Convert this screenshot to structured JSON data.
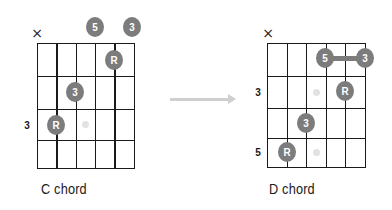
{
  "diagrams": [
    {
      "id": "c",
      "label": "C chord",
      "grid": {
        "x": [
          37,
          56.3,
          75.6,
          94.9,
          114.2,
          133.5
        ],
        "y": [
          43,
          76,
          109,
          140,
          168
        ]
      },
      "mute": {
        "symbol": "×",
        "x": 37,
        "y": 33
      },
      "fret_labels": [
        {
          "text": "3",
          "x": 27,
          "y": 125
        }
      ],
      "dots": [
        {
          "text": "5",
          "x": 95,
          "y": 27
        },
        {
          "text": "3",
          "x": 132,
          "y": 27
        },
        {
          "text": "R",
          "x": 114,
          "y": 60
        },
        {
          "text": "3",
          "x": 75,
          "y": 92
        },
        {
          "text": "R",
          "x": 56,
          "y": 125
        }
      ],
      "ghost_dots": [
        {
          "x": 85,
          "y": 124
        }
      ],
      "label_pos": {
        "x": 41,
        "y": 180
      }
    },
    {
      "id": "d",
      "label": "D chord",
      "grid": {
        "x": [
          267,
          286.5,
          306,
          325.5,
          345,
          364.5
        ],
        "y": [
          43,
          76,
          108,
          138,
          167
        ]
      },
      "mute": {
        "symbol": "×",
        "x": 268,
        "y": 33
      },
      "fret_labels": [
        {
          "text": "3",
          "x": 258,
          "y": 92
        },
        {
          "text": "5",
          "x": 258,
          "y": 152
        }
      ],
      "dots": [
        {
          "text": "5",
          "x": 325,
          "y": 58
        },
        {
          "text": "3",
          "x": 365,
          "y": 58
        },
        {
          "text": "R",
          "x": 345,
          "y": 91
        },
        {
          "text": "3",
          "x": 306,
          "y": 123
        },
        {
          "text": "R",
          "x": 287,
          "y": 152
        }
      ],
      "bar": {
        "x1": 325,
        "x2": 365,
        "y": 58
      },
      "ghost_dots": [
        {
          "x": 316,
          "y": 92
        },
        {
          "x": 316,
          "y": 152
        }
      ],
      "label_pos": {
        "x": 269,
        "y": 180
      }
    }
  ],
  "arrow": {
    "x1": 170,
    "x2": 236,
    "y": 99,
    "color": "#cfcfcf"
  },
  "colors": {
    "dot": "#7c7c7c",
    "dot_text": "#ffffff",
    "grid": "#1a1a1a",
    "ghost": "#e2e2e2"
  }
}
